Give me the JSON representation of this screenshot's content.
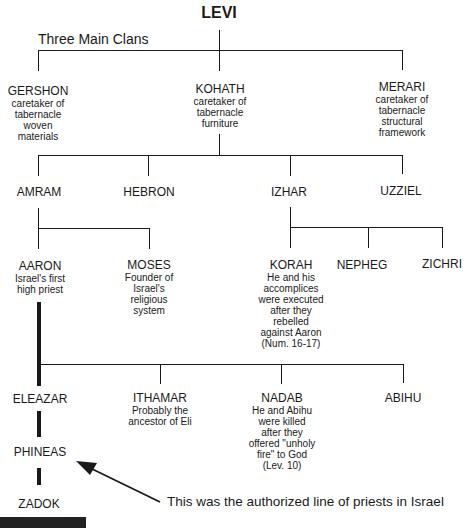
{
  "title": "LEVI",
  "section_label": "Three Main Clans",
  "clans": [
    {
      "name": "GERSHON",
      "desc": [
        "caretaker of",
        "tabernacle",
        "woven",
        "materials"
      ]
    },
    {
      "name": "KOHATH",
      "desc": [
        "caretaker of",
        "tabernacle",
        "furniture"
      ]
    },
    {
      "name": "MERARI",
      "desc": [
        "caretaker of",
        "tabernacle",
        "structural",
        "framework"
      ]
    }
  ],
  "kohath_sons": [
    {
      "name": "AMRAM"
    },
    {
      "name": "HEBRON"
    },
    {
      "name": "IZHAR"
    },
    {
      "name": "UZZIEL"
    }
  ],
  "amram_sons": [
    {
      "name": "AARON",
      "desc": [
        "Israel's first",
        "high priest"
      ]
    },
    {
      "name": "MOSES",
      "desc": [
        "Founder of",
        "Israel's",
        "religious",
        "system"
      ]
    }
  ],
  "izhar_sons": [
    {
      "name": "KORAH",
      "desc": [
        "He and his",
        "accomplices",
        "were executed",
        "after they",
        "rebelled",
        "against Aaron",
        "(Num. 16-17)"
      ]
    },
    {
      "name": "NEPHEG"
    },
    {
      "name": "ZICHRI"
    }
  ],
  "aaron_sons": [
    {
      "name": "ELEAZAR"
    },
    {
      "name": "ITHAMAR",
      "desc": [
        "Probably the",
        "ancestor of Eli"
      ]
    },
    {
      "name": "NADAB",
      "desc": [
        "He and Abihu",
        "were killed",
        "after they",
        "offered \"unholy",
        "fire\" to God",
        "(Lev. 10)"
      ]
    },
    {
      "name": "ABIHU"
    }
  ],
  "priestly_line": [
    {
      "name": "PHINEAS"
    },
    {
      "name": "ZADOK"
    }
  ],
  "annotation": "This was the authorized line of priests in Israel",
  "colors": {
    "line": "#1a1a1a",
    "text": "#1a1a1a",
    "background": "#ffffff"
  }
}
